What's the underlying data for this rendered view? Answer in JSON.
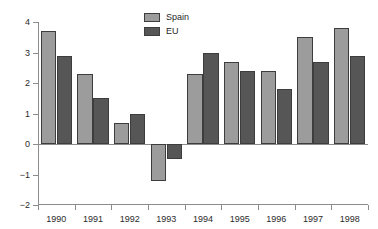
{
  "top_caption": "",
  "legend": {
    "position": "top-center",
    "entries": [
      {
        "label": "Spain",
        "color": "#9c9c9c"
      },
      {
        "label": "EU",
        "color": "#565656"
      }
    ]
  },
  "axes": {
    "y_ticks": [
      "4",
      "3",
      "2",
      "1",
      "0",
      "-1",
      "-2"
    ],
    "x_ticks": [
      "1990",
      "1991",
      "1992",
      "1993",
      "1994",
      "1995",
      "1996",
      "1997",
      "1998"
    ]
  },
  "chart_data": {
    "type": "bar",
    "title": "",
    "subtitle": "",
    "xlabel": "",
    "ylabel": "",
    "ylim": [
      -2,
      4
    ],
    "grid": false,
    "legend_position": "top-center",
    "categories": [
      "1990",
      "1991",
      "1992",
      "1993",
      "1994",
      "1995",
      "1996",
      "1997",
      "1998"
    ],
    "series": [
      {
        "name": "Spain",
        "color": "#9c9c9c",
        "values": [
          3.7,
          2.3,
          0.7,
          -1.2,
          2.3,
          2.7,
          2.4,
          3.5,
          3.8
        ]
      },
      {
        "name": "EU",
        "color": "#565656",
        "values": [
          2.9,
          1.5,
          1.0,
          -0.5,
          3.0,
          2.4,
          1.8,
          2.7,
          2.9
        ]
      }
    ]
  }
}
